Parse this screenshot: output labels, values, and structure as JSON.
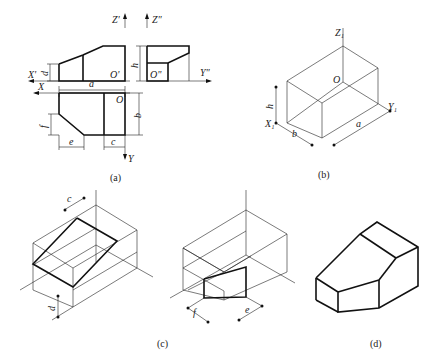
{
  "figure": {
    "panels": [
      {
        "id": "a",
        "caption": "(a)",
        "description": "Orthographic three views with dimensions"
      },
      {
        "id": "b",
        "caption": "(b)",
        "description": "Isometric bounding box with axes"
      },
      {
        "id": "c",
        "caption": "(c)",
        "description": "Cutting inclined plane in isometric box"
      },
      {
        "id": "d",
        "caption": "(d)",
        "description": "Finished isometric solid"
      }
    ],
    "view_a": {
      "front_axes": {
        "z": "Z'",
        "x": "X'",
        "origin": "O'"
      },
      "side_axes": {
        "z": "Z\"",
        "y": "Y\"",
        "origin": "O\""
      },
      "top_axes": {
        "x": "X",
        "y": "Y",
        "origin": "O"
      },
      "dims": {
        "a": "a",
        "b": "b",
        "c": "c",
        "d": "d",
        "e": "e",
        "f": "f",
        "h": "h"
      }
    },
    "view_b": {
      "axes": {
        "z": "Z₁",
        "x": "X₁",
        "y": "Y₁",
        "origin": "O"
      },
      "dims": {
        "h": "h",
        "b": "b",
        "a": "a"
      }
    },
    "view_c": {
      "dims": {
        "c": "c",
        "d": "d"
      }
    },
    "view_e": {
      "dims": {
        "f": "f",
        "e": "e"
      }
    }
  }
}
